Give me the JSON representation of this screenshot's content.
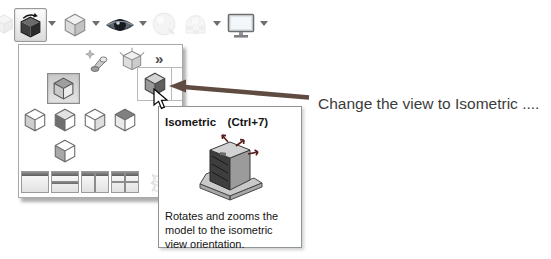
{
  "colors": {
    "arrow": "#5f4b42",
    "panel_border": "#a9a9a9",
    "tooltip_border": "#8f9499",
    "annotation_text": "#3c3c3c"
  },
  "toolbar": {
    "items": [
      {
        "id": "view-orientation",
        "icon": "view-orientation-cube-icon",
        "pressed": true,
        "has_dropdown": true
      },
      {
        "id": "display-style",
        "icon": "display-style-cube-icon",
        "has_dropdown": true
      },
      {
        "id": "hide-show-items",
        "icon": "eye-icon",
        "has_dropdown": true
      },
      {
        "id": "edit-appearance",
        "icon": "appearance-sphere-icon",
        "disabled": true
      },
      {
        "id": "apply-scene",
        "icon": "scene-icon",
        "disabled": true,
        "has_dropdown": true
      },
      {
        "id": "view-settings",
        "icon": "monitor-icon",
        "has_dropdown": true
      }
    ]
  },
  "flyout": {
    "chevron": "»",
    "tool_icons": [
      "new-view-icon",
      "view-selector-icon"
    ],
    "view_buttons": [
      "normal-to",
      "front",
      "back",
      "left",
      "right",
      "bottom",
      "isometric"
    ],
    "viewport_buttons": [
      "single-view",
      "two-view-horizontal",
      "two-view-vertical",
      "four-view"
    ],
    "selected_view": "normal-to",
    "hovered_view": "isometric"
  },
  "tooltip": {
    "title": "Isometric",
    "shortcut": "(Ctrl+7)",
    "description": "Rotates and zooms the model to the isometric view orientation."
  },
  "annotation": {
    "text": "Change the view to Isometric ...."
  }
}
